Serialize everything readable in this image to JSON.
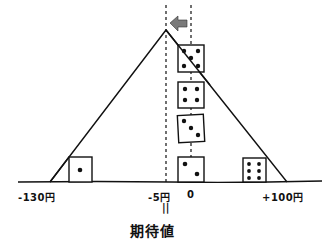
{
  "diagram": {
    "type": "expected-value-balance",
    "axis": {
      "ticks": [
        {
          "label": "-130円",
          "value": -130
        },
        {
          "label": "-5円",
          "value": -5
        },
        {
          "label": "0",
          "value": 0
        },
        {
          "label": "+100円",
          "value": 100
        }
      ]
    },
    "equals_mark": "||",
    "title": "期待値",
    "dice": [
      {
        "face": 1,
        "position": "-130円"
      },
      {
        "face": 2,
        "position": "0"
      },
      {
        "face": 3,
        "position": "0"
      },
      {
        "face": 4,
        "position": "0"
      },
      {
        "face": 5,
        "position": "0"
      },
      {
        "face": 6,
        "position": "+100円"
      }
    ],
    "arrow": {
      "direction": "left",
      "color": "#7a7a7a"
    },
    "colors": {
      "ink": "#111111",
      "background": "#ffffff",
      "arrow": "#7a7a7a"
    }
  }
}
